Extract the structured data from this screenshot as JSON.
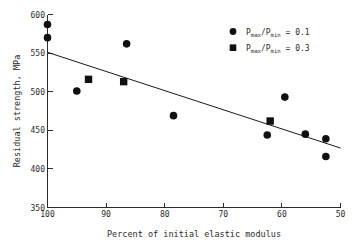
{
  "chart_data": {
    "type": "scatter",
    "title": "",
    "xlabel": "Percent of initial elastic modulus",
    "ylabel": "Residual strength, MPa",
    "xlim": [
      100,
      50
    ],
    "ylim": [
      350,
      600
    ],
    "x_ticks": [
      100,
      90,
      80,
      70,
      60,
      50
    ],
    "y_ticks": [
      350,
      400,
      450,
      500,
      550,
      600
    ],
    "x_tick_labels": [
      "100",
      "90",
      "80",
      "70",
      "60",
      "50"
    ],
    "y_tick_labels": [
      "350",
      "400",
      "450",
      "500",
      "550",
      "600"
    ],
    "x_axis_reversed": true,
    "grid": false,
    "legend_position": "top-right",
    "series": [
      {
        "name": "Pmax/Pmin = 0.1",
        "marker": "circle",
        "color": "#111111",
        "points": [
          {
            "x": 100.0,
            "y": 587
          },
          {
            "x": 100.0,
            "y": 570
          },
          {
            "x": 95.0,
            "y": 501
          },
          {
            "x": 86.5,
            "y": 562
          },
          {
            "x": 78.5,
            "y": 469
          },
          {
            "x": 62.5,
            "y": 444
          },
          {
            "x": 59.5,
            "y": 493
          },
          {
            "x": 56.0,
            "y": 445
          },
          {
            "x": 52.5,
            "y": 439
          },
          {
            "x": 52.5,
            "y": 416
          }
        ]
      },
      {
        "name": "Pmax/Pmin = 0.3",
        "marker": "square",
        "color": "#111111",
        "points": [
          {
            "x": 93.0,
            "y": 516
          },
          {
            "x": 87.0,
            "y": 513
          },
          {
            "x": 62.0,
            "y": 462
          }
        ]
      }
    ],
    "trend_line": {
      "name": "linear fit",
      "x_start": 100,
      "y_start": 551,
      "x_end": 50,
      "y_end": 427
    },
    "legend": [
      {
        "marker": "circle",
        "prefix": "P",
        "sub1": "max",
        "slash": "/P",
        "sub2": "min",
        "suffix": " = 0.1"
      },
      {
        "marker": "square",
        "prefix": "P",
        "sub1": "max",
        "slash": "/P",
        "sub2": "min",
        "suffix": " = 0.3"
      }
    ]
  }
}
